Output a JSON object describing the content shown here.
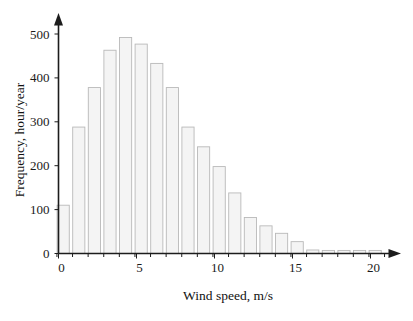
{
  "chart_data": {
    "type": "bar",
    "title": "",
    "subtitle": "",
    "xlabel": "Wind speed, m/s",
    "ylabel": "Frequency, hour/year",
    "xlim": [
      -0.4,
      21.6
    ],
    "ylim": [
      0,
      530
    ],
    "grid": false,
    "legend": null,
    "xticks": [
      0,
      5,
      10,
      15,
      20
    ],
    "xtick_labels": [
      "0",
      "5",
      "10",
      "15",
      "20"
    ],
    "yticks": [
      0,
      100,
      200,
      300,
      400,
      500
    ],
    "ytick_labels": [
      "0",
      "100",
      "200",
      "300",
      "400",
      "500"
    ],
    "bar_width": 0.78,
    "categories": [
      0.3,
      1.3,
      2.3,
      3.3,
      4.3,
      5.3,
      6.3,
      7.3,
      8.3,
      9.3,
      10.3,
      11.3,
      12.3,
      13.3,
      14.3,
      15.3,
      16.3,
      17.3,
      18.3,
      19.3,
      20.3
    ],
    "values": [
      110,
      288,
      378,
      463,
      492,
      477,
      433,
      378,
      288,
      243,
      198,
      138,
      82,
      63,
      46,
      27,
      8,
      7,
      7,
      7,
      7
    ],
    "bar_fill": "#f4f4f4",
    "bar_stroke": "#b9b9b9",
    "axis_color": "#1c1c1c"
  },
  "axes": {
    "x_title": "Wind speed, m/s",
    "y_title": "Frequency, hour/year"
  }
}
